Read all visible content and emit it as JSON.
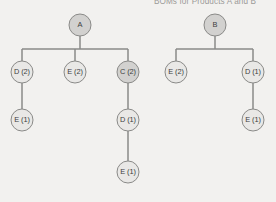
{
  "title": "BOMs for Products A and B",
  "colors": {
    "background": "#f2f1ef",
    "node_light_fill": "#e9e8e6",
    "node_dark_fill": "#d2d1cf",
    "stroke": "#8a8a88",
    "label_text": "#3d3d3d",
    "title_text": "#9b9a98"
  },
  "chart_data": {
    "type": "diagram",
    "title": "BOMs for Products A and B",
    "trees": [
      {
        "name": "Product A BOM",
        "root": "A",
        "nodes": [
          {
            "id": "a-root",
            "label": "A",
            "x": 80,
            "y": 25,
            "shade": "dark"
          },
          {
            "id": "a-d2",
            "label": "D (2)",
            "x": 22,
            "y": 72,
            "shade": "light"
          },
          {
            "id": "a-e2",
            "label": "E (2)",
            "x": 75,
            "y": 72,
            "shade": "light"
          },
          {
            "id": "a-c2",
            "label": "C (2)",
            "x": 128,
            "y": 72,
            "shade": "dark"
          },
          {
            "id": "a-e1",
            "label": "E (1)",
            "x": 22,
            "y": 120,
            "shade": "light"
          },
          {
            "id": "a-d1",
            "label": "D (1)",
            "x": 128,
            "y": 120,
            "shade": "light"
          },
          {
            "id": "a-e1b",
            "label": "E (1)",
            "x": 128,
            "y": 172,
            "shade": "light"
          }
        ],
        "edges": [
          {
            "from": "a-root",
            "to": "a-d2"
          },
          {
            "from": "a-root",
            "to": "a-e2"
          },
          {
            "from": "a-root",
            "to": "a-c2"
          },
          {
            "from": "a-d2",
            "to": "a-e1"
          },
          {
            "from": "a-c2",
            "to": "a-d1"
          },
          {
            "from": "a-d1",
            "to": "a-e1b"
          }
        ]
      },
      {
        "name": "Product B BOM",
        "root": "B",
        "nodes": [
          {
            "id": "b-root",
            "label": "B",
            "x": 215,
            "y": 25,
            "shade": "dark"
          },
          {
            "id": "b-e2",
            "label": "E (2)",
            "x": 176,
            "y": 72,
            "shade": "light"
          },
          {
            "id": "b-d1",
            "label": "D (1)",
            "x": 253,
            "y": 72,
            "shade": "light"
          },
          {
            "id": "b-e1",
            "label": "E (1)",
            "x": 253,
            "y": 120,
            "shade": "light"
          }
        ],
        "edges": [
          {
            "from": "b-root",
            "to": "b-e2"
          },
          {
            "from": "b-root",
            "to": "b-d1"
          },
          {
            "from": "b-d1",
            "to": "b-e1"
          }
        ]
      }
    ],
    "title_position": {
      "x": 205,
      "y": 1
    },
    "node_radius": 11
  }
}
